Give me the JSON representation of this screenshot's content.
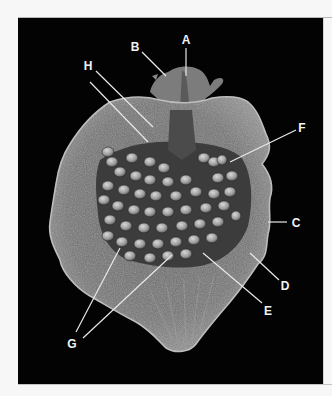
{
  "figure": {
    "background_color": "#030303",
    "label_color": "#f2f2f2",
    "labels": [
      {
        "id": "A",
        "text": "A",
        "x": 186,
        "y": 40
      },
      {
        "id": "B",
        "text": "B",
        "x": 135,
        "y": 47
      },
      {
        "id": "C",
        "text": "C",
        "x": 296,
        "y": 223
      },
      {
        "id": "D",
        "text": "D",
        "x": 285,
        "y": 286
      },
      {
        "id": "E",
        "text": "E",
        "x": 268,
        "y": 311
      },
      {
        "id": "F",
        "text": "F",
        "x": 302,
        "y": 128
      },
      {
        "id": "G",
        "text": "G",
        "x": 72,
        "y": 344
      },
      {
        "id": "H",
        "text": "H",
        "x": 88,
        "y": 66
      }
    ]
  }
}
